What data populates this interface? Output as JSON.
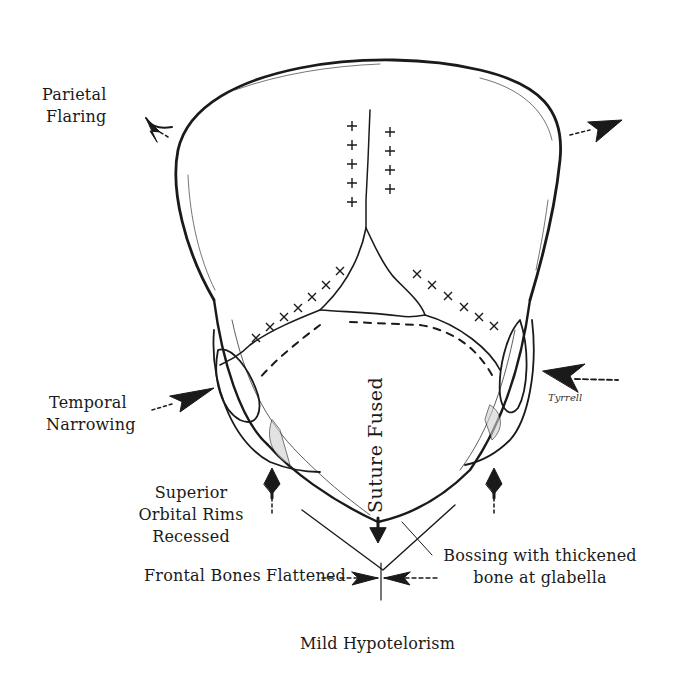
{
  "diagram": {
    "colors": {
      "ink": "#1a1a1a",
      "background": "#ffffff"
    },
    "labels": {
      "parietal_flaring_line1": "Parietal",
      "parietal_flaring_line2": "Flaring",
      "temporal_narrowing_line1": "Temporal",
      "temporal_narrowing_line2": "Narrowing",
      "superior_orbital_line1": "Superior",
      "superior_orbital_line2": "Orbital Rims",
      "superior_orbital_line3": "Recessed",
      "frontal_bones": "Frontal Bones Flattened",
      "bossing_line1": "Bossing with thickened",
      "bossing_line2": "bone at glabella",
      "hypotelorism": "Mild Hypotelorism",
      "suture_fused": "Suture Fused",
      "signature": "Tyrrell"
    },
    "markers": {
      "sagittal_plus_left_count": 5,
      "sagittal_plus_right_count": 4,
      "coronal_x_left_count": 8,
      "coronal_x_right_count": 6
    }
  }
}
